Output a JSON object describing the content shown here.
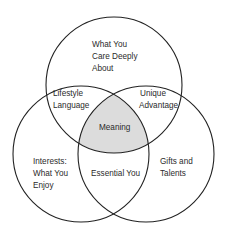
{
  "diagram": {
    "type": "venn-3",
    "colors": {
      "stroke": "#222222",
      "center_fill": "#dcdcdc",
      "background": "#ffffff",
      "text": "#2b2b2b"
    },
    "circles": [
      {
        "id": "top",
        "cx": 114,
        "cy": 85,
        "r": 68
      },
      {
        "id": "left",
        "cx": 81,
        "cy": 154,
        "r": 68
      },
      {
        "id": "right",
        "cx": 146,
        "cy": 154,
        "r": 68
      }
    ],
    "regions": {
      "top_only": [
        "What You",
        "Care Deeply",
        "About"
      ],
      "top_left": [
        "Lifestyle",
        "Language"
      ],
      "top_right": [
        "Unique",
        "Advantage"
      ],
      "center": [
        "Meaning"
      ],
      "left_only": [
        "Interests:",
        "What You",
        "Enjoy"
      ],
      "left_right": [
        "Essential You"
      ],
      "right_only": [
        "Gifts and",
        "Talents"
      ]
    }
  }
}
